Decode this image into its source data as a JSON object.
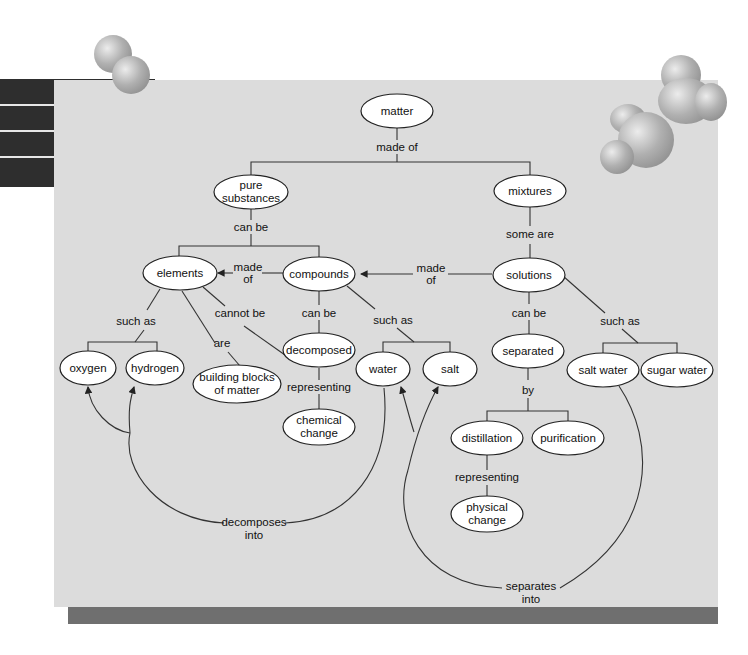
{
  "diagram": {
    "colors": {
      "panel": "#dcdcdc",
      "shadow_bar": "#6f6f6f",
      "left_stack": "#2e2e2e",
      "node_fill": "#ffffff",
      "line": "#333333"
    },
    "nodes": {
      "matter": {
        "label": "matter"
      },
      "pure_substances": {
        "line1": "pure",
        "line2": "substances"
      },
      "mixtures": {
        "label": "mixtures"
      },
      "elements": {
        "label": "elements"
      },
      "compounds": {
        "label": "compounds"
      },
      "solutions": {
        "label": "solutions"
      },
      "oxygen": {
        "label": "oxygen"
      },
      "hydrogen": {
        "label": "hydrogen"
      },
      "building_blocks": {
        "line1": "building blocks",
        "line2": "of matter"
      },
      "decomposed": {
        "label": "decomposed"
      },
      "chemical_change": {
        "line1": "chemical",
        "line2": "change"
      },
      "water": {
        "label": "water"
      },
      "salt": {
        "label": "salt"
      },
      "separated": {
        "label": "separated"
      },
      "salt_water": {
        "label": "salt water"
      },
      "sugar_water": {
        "label": "sugar water"
      },
      "distillation": {
        "label": "distillation"
      },
      "purification": {
        "label": "purification"
      },
      "physical_change": {
        "line1": "physical",
        "line2": "change"
      }
    },
    "links": {
      "matter_made_of": "made of",
      "pure_can_be": "can be",
      "mixtures_some_are": "some are",
      "compounds_made_of": {
        "line1": "made",
        "line2": "of"
      },
      "solutions_made_of": {
        "line1": "made",
        "line2": "of"
      },
      "elements_such_as": "such as",
      "elements_cannot_be": "cannot be",
      "elements_are": "are",
      "compounds_can_be": "can be",
      "compounds_such_as": "such as",
      "decomposed_representing": "representing",
      "solutions_can_be": "can be",
      "solutions_such_as": "such as",
      "separated_by": "by",
      "distillation_representing": "representing",
      "water_decomposes_into": {
        "line1": "decomposes",
        "line2": "into"
      },
      "saltwater_separates_into": {
        "line1": "separates",
        "line2": "into"
      }
    }
  }
}
